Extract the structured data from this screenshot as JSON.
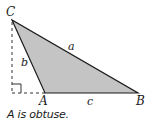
{
  "diagram": {
    "vertices": {
      "A": {
        "label": "A",
        "x": 45,
        "y": 93
      },
      "B": {
        "label": "B",
        "x": 138,
        "y": 93
      },
      "C": {
        "label": "C",
        "x": 12,
        "y": 20
      }
    },
    "sides": {
      "a": {
        "label": "a",
        "between": [
          "B",
          "C"
        ]
      },
      "b": {
        "label": "b",
        "between": [
          "A",
          "C"
        ]
      },
      "c": {
        "label": "c",
        "between": [
          "A",
          "B"
        ]
      }
    },
    "altitude": {
      "from": "C",
      "foot": {
        "x": 12,
        "y": 93
      },
      "style": "dashed",
      "right_angle_marker": true
    },
    "colors": {
      "fill": "#c4c4c4",
      "stroke": "#1a1a1a",
      "dashed": "#333333"
    }
  },
  "caption": "A is obtuse."
}
